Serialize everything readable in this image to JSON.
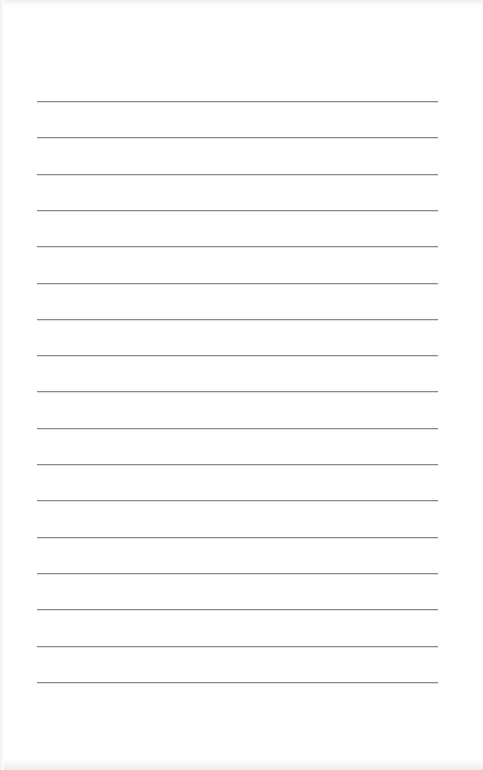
{
  "document": {
    "type": "lined-paper",
    "background_color": "#ffffff",
    "rule_color": "#8a8a8a",
    "rule_count": 17,
    "rule_start_y": 101,
    "rule_spacing": 36.3,
    "rule_left_x": 37,
    "rule_right_x": 438
  }
}
